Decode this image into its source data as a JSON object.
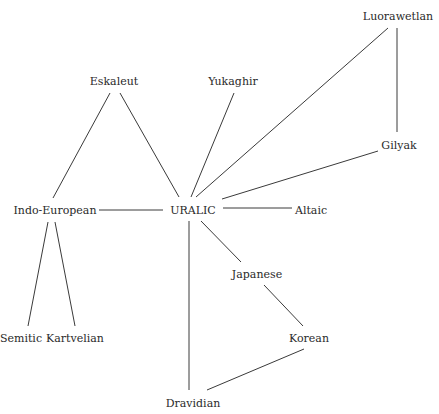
{
  "diagram": {
    "type": "network",
    "line_color": "#3a3a3a",
    "text_color": "#2a2a2a",
    "nodes": [
      {
        "id": "luorawetlan",
        "label": "Luorawetlan",
        "x": 398,
        "y": 16
      },
      {
        "id": "eskaleut",
        "label": "Eskaleut",
        "x": 114,
        "y": 81
      },
      {
        "id": "yukaghir",
        "label": "Yukaghir",
        "x": 233,
        "y": 81
      },
      {
        "id": "gilyak",
        "label": "Gilyak",
        "x": 399,
        "y": 145
      },
      {
        "id": "indo-european",
        "label": "Indo-European",
        "x": 55,
        "y": 210
      },
      {
        "id": "uralic",
        "label": "URALIC",
        "x": 193,
        "y": 210
      },
      {
        "id": "altaic",
        "label": "Altaic",
        "x": 311,
        "y": 210
      },
      {
        "id": "japanese",
        "label": "Japanese",
        "x": 257,
        "y": 274
      },
      {
        "id": "semitic",
        "label": "Semitic",
        "x": 21,
        "y": 338
      },
      {
        "id": "kartvelian",
        "label": "Kartvelian",
        "x": 75,
        "y": 338
      },
      {
        "id": "korean",
        "label": "Korean",
        "x": 309,
        "y": 338
      },
      {
        "id": "dravidian",
        "label": "Dravidian",
        "x": 193,
        "y": 403
      }
    ],
    "edges": [
      {
        "from": "eskaleut",
        "to": "indo-european",
        "x1": 110,
        "y1": 93,
        "x2": 53,
        "y2": 198
      },
      {
        "from": "eskaleut",
        "to": "uralic",
        "x1": 120,
        "y1": 93,
        "x2": 179,
        "y2": 197
      },
      {
        "from": "yukaghir",
        "to": "uralic",
        "x1": 234,
        "y1": 93,
        "x2": 191,
        "y2": 197
      },
      {
        "from": "luorawetlan",
        "to": "uralic",
        "x1": 388,
        "y1": 28,
        "x2": 196,
        "y2": 197
      },
      {
        "from": "luorawetlan",
        "to": "gilyak",
        "x1": 397,
        "y1": 28,
        "x2": 397,
        "y2": 132
      },
      {
        "from": "gilyak",
        "to": "uralic",
        "x1": 378,
        "y1": 151,
        "x2": 222,
        "y2": 199
      },
      {
        "from": "indo-european",
        "to": "uralic",
        "x1": 99,
        "y1": 210,
        "x2": 163,
        "y2": 210
      },
      {
        "from": "uralic",
        "to": "altaic",
        "x1": 223,
        "y1": 208,
        "x2": 292,
        "y2": 208
      },
      {
        "from": "uralic",
        "to": "japanese",
        "x1": 201,
        "y1": 221,
        "x2": 241,
        "y2": 262
      },
      {
        "from": "uralic",
        "to": "dravidian",
        "x1": 189,
        "y1": 221,
        "x2": 189,
        "y2": 390
      },
      {
        "from": "indo-european",
        "to": "semitic",
        "x1": 48,
        "y1": 222,
        "x2": 28,
        "y2": 326
      },
      {
        "from": "indo-european",
        "to": "kartvelian",
        "x1": 55,
        "y1": 222,
        "x2": 75,
        "y2": 326
      },
      {
        "from": "japanese",
        "to": "korean",
        "x1": 264,
        "y1": 285,
        "x2": 303,
        "y2": 326
      },
      {
        "from": "korean",
        "to": "dravidian",
        "x1": 304,
        "y1": 349,
        "x2": 207,
        "y2": 390
      }
    ]
  }
}
